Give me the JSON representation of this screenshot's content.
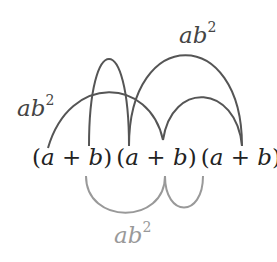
{
  "diagram": {
    "title": "",
    "factors": [
      {
        "open": "(",
        "a": "a",
        "op": " + ",
        "b": "b",
        "close": ")"
      },
      {
        "open": "(",
        "a": "a",
        "op": " + ",
        "b": "b",
        "close": ")"
      },
      {
        "open": "(",
        "a": "a",
        "op": " + ",
        "b": "b",
        "close": ")"
      }
    ],
    "labels": {
      "top_right": {
        "base": "ab",
        "exp": "2"
      },
      "left": {
        "base": "ab",
        "exp": "2"
      },
      "bottom": {
        "base": "ab",
        "exp": "2"
      }
    },
    "colors": {
      "upper_arcs": "#555555",
      "lower_arcs": "#999999",
      "text": "#222222",
      "bottom_label": "#999999"
    }
  }
}
